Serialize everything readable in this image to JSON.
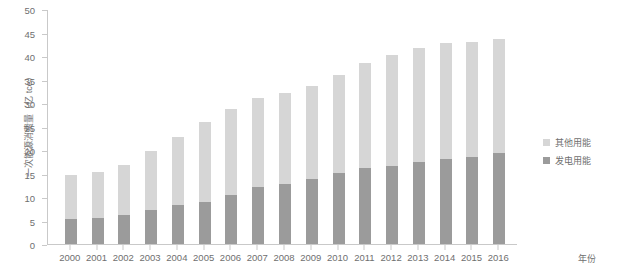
{
  "chart_data": {
    "type": "bar",
    "stacked": true,
    "title": "",
    "xlabel": "年份",
    "ylabel": "一次能源消费量（亿 tce）",
    "categories": [
      "2000",
      "2001",
      "2002",
      "2003",
      "2004",
      "2005",
      "2006",
      "2007",
      "2008",
      "2009",
      "2010",
      "2011",
      "2012",
      "2013",
      "2014",
      "2015",
      "2016"
    ],
    "series": [
      {
        "name": "发电用能",
        "color": "#9b9b9b",
        "values": [
          5.3,
          5.6,
          6.2,
          7.3,
          8.3,
          9.0,
          10.5,
          12.2,
          12.8,
          13.9,
          15.2,
          16.1,
          16.5,
          17.5,
          18.0,
          18.5,
          19.3
        ]
      },
      {
        "name": "其他用能",
        "color": "#d6d6d6",
        "values": [
          9.4,
          9.8,
          10.7,
          12.4,
          14.5,
          16.9,
          18.2,
          18.9,
          19.3,
          19.7,
          20.8,
          22.5,
          23.7,
          24.2,
          24.7,
          24.5,
          24.3
        ]
      }
    ],
    "totals": [
      14.7,
      15.4,
      16.9,
      19.7,
      22.8,
      25.9,
      28.7,
      31.1,
      32.1,
      33.6,
      36.0,
      38.6,
      40.2,
      41.7,
      42.7,
      43.0,
      43.6
    ],
    "ylim": [
      0,
      50
    ],
    "ytick_values": [
      0,
      5,
      10,
      15,
      20,
      25,
      30,
      35,
      40,
      45,
      50
    ],
    "ytick_labels": [
      "0",
      "5",
      "10",
      "15",
      "20",
      "25",
      "30",
      "35",
      "40",
      "45",
      "50"
    ],
    "grid": false,
    "legend_position": "right"
  },
  "legend": {
    "items": [
      {
        "label": "其他用能",
        "color": "#d6d6d6"
      },
      {
        "label": "发电用能",
        "color": "#9b9b9b"
      }
    ]
  }
}
